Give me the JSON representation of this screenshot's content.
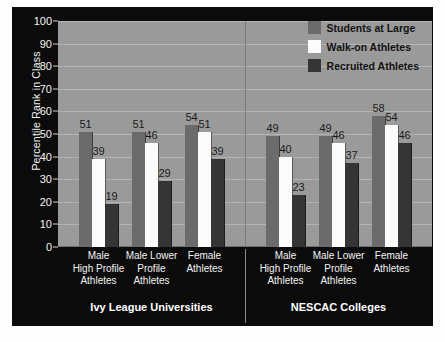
{
  "chart_data": {
    "type": "bar",
    "title": "",
    "subtitle": "",
    "xlabel": "",
    "ylabel": "Percentile Rank in Class",
    "ylim": [
      0,
      100
    ],
    "yticks": [
      0,
      10,
      20,
      30,
      40,
      50,
      60,
      70,
      80,
      90,
      100
    ],
    "grid": true,
    "legend_position": "top-right",
    "categories": [
      "Male\nHigh Profile\nAthletes",
      "Male Lower\nProfile\nAthletes",
      "Female\nAthletes"
    ],
    "category_lines": [
      [
        "Male",
        "High Profile",
        "Athletes"
      ],
      [
        "Male Lower",
        "Profile",
        "Athletes"
      ],
      [
        "Female",
        "Athletes"
      ]
    ],
    "groups": [
      {
        "name": "Ivy League Universities",
        "series": [
          {
            "name": "Students at Large",
            "values": [
              51,
              51,
              54
            ]
          },
          {
            "name": "Walk-on Athletes",
            "values": [
              39,
              46,
              51
            ]
          },
          {
            "name": "Recruited Athletes",
            "values": [
              19,
              29,
              39
            ]
          }
        ]
      },
      {
        "name": "NESCAC Colleges",
        "series": [
          {
            "name": "Students at Large",
            "values": [
              49,
              49,
              58
            ]
          },
          {
            "name": "Walk-on Athletes",
            "values": [
              40,
              46,
              54
            ]
          },
          {
            "name": "Recruited Athletes",
            "values": [
              23,
              37,
              46
            ]
          }
        ]
      }
    ],
    "legend": [
      {
        "label": "Students at Large",
        "color": "#6b6b6b"
      },
      {
        "label": "Walk-on Athletes",
        "color": "#fbfbfb"
      },
      {
        "label": "Recruited Athletes",
        "color": "#353535"
      }
    ],
    "colors": {
      "panel_background": "#0b0b0b",
      "plot_background": "#9a9a9a",
      "gridline": "#b4b4b4",
      "series_students_at_large": "#6b6b6b",
      "series_walk_on_athletes": "#fbfbfb",
      "series_recruited_athletes": "#353535",
      "axis_text": "#f4f4f4",
      "value_label": "#1a1a1a"
    }
  }
}
